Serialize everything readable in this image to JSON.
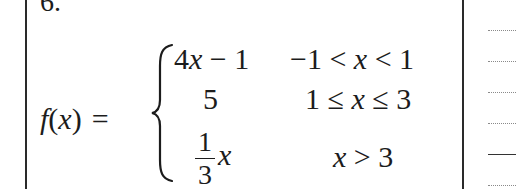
{
  "problem": {
    "number": "6.",
    "lhs": "f(x) =",
    "lhs_parts": {
      "f": "f",
      "open": "(",
      "x": "x",
      "close": ")",
      "eq": "="
    },
    "cases": [
      {
        "expression": "4x − 1",
        "expr_parts": {
          "coef": "4",
          "var": "x",
          "rest": " − 1"
        },
        "condition": "−1 < x < 1",
        "cond_parts": {
          "a": "−1 < ",
          "var": "x",
          "b": " < 1"
        }
      },
      {
        "expression": "5",
        "condition": "1 ≤ x ≤ 3",
        "cond_parts": {
          "a": "1 ≤ ",
          "var": "x",
          "b": " ≤ 3"
        }
      },
      {
        "expression": "(1/3)x",
        "expr_parts": {
          "numerator": "1",
          "denominator": "3",
          "var": "x"
        },
        "condition": "x > 3",
        "cond_parts": {
          "var": "x",
          "b": " > 3"
        }
      }
    ]
  },
  "answer_lines": {
    "count": 6,
    "styles": [
      "dotted",
      "dotted",
      "dotted",
      "dotted",
      "solid",
      "dotted"
    ]
  }
}
